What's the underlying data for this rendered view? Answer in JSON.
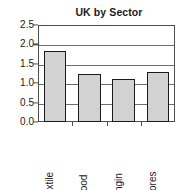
{
  "chart_data": {
    "type": "bar",
    "title": "UK by Sector",
    "xlabel": "",
    "ylabel": "",
    "categories": [
      "Textile",
      "Food",
      "Engin",
      "Stores"
    ],
    "values": [
      1.82,
      1.24,
      1.1,
      1.3
    ],
    "ylim": [
      0.0,
      2.5
    ],
    "ytick_labels": [
      "2.5",
      "2.0",
      "1.5",
      "1.0",
      "0.5",
      "0.0"
    ],
    "ytick_values": [
      2.5,
      2.0,
      1.5,
      1.0,
      0.5,
      0.0
    ],
    "grid": true,
    "grid_axis": "y",
    "legend": false,
    "legend_position": "none",
    "bar_fill_color": "#d2d2d2",
    "bar_edge_color": "#1a1a1a",
    "axis_color": "#4d4d4d",
    "gridline_color": "#6e6e6e",
    "background_color": "#ffffff",
    "text_color": "#1a1a1a",
    "category_label_rotation": 90
  }
}
